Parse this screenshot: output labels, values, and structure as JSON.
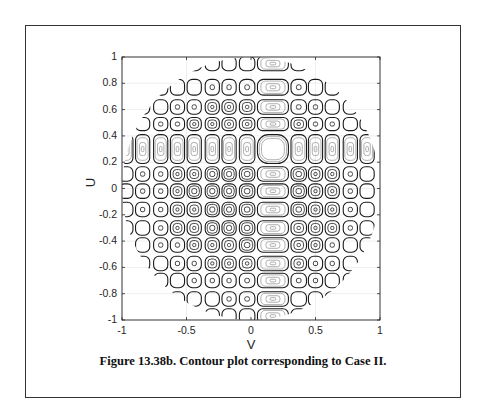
{
  "figure": {
    "caption": "Figure 13.38b. Contour plot corresponding to Case II."
  },
  "chart_data": {
    "type": "contour",
    "title": "",
    "xlabel": "V",
    "ylabel": "U",
    "xlim": [
      -1,
      1
    ],
    "ylim": [
      -1,
      1
    ],
    "x_ticks": [
      -1,
      -0.5,
      0,
      0.5,
      1
    ],
    "x_tick_labels": [
      "-1",
      "-0.5",
      "0",
      "0.5",
      "1"
    ],
    "y_ticks": [
      1,
      0.8,
      0.6,
      0.4,
      0.2,
      0,
      -0.2,
      -0.4,
      -0.6,
      -0.8,
      -1
    ],
    "y_tick_labels": [
      "1",
      "0.8",
      "0.6",
      "0.4",
      "0.2",
      "0",
      "-0.2",
      "-0.4",
      "-0.6",
      "-0.8",
      "-1"
    ],
    "grid": true,
    "domain": "unit circle (V^2 + U^2 <= 1)",
    "main_lobe": {
      "V": 0.17,
      "U": 0.3
    },
    "column_centers_V": [
      -0.97,
      -0.84,
      -0.7,
      -0.57,
      -0.44,
      -0.3,
      -0.17,
      -0.03,
      0.17,
      0.37,
      0.5,
      0.63,
      0.77,
      0.9
    ],
    "column_half_widths": [
      0.055,
      0.055,
      0.055,
      0.055,
      0.055,
      0.055,
      0.055,
      0.06,
      0.12,
      0.06,
      0.055,
      0.055,
      0.055,
      0.055
    ],
    "row_centers_U": [
      0.95,
      0.77,
      0.62,
      0.49,
      0.3,
      0.11,
      -0.02,
      -0.16,
      -0.3,
      -0.43,
      -0.57,
      -0.7,
      -0.84,
      -0.97
    ],
    "row_half_heights": [
      0.055,
      0.06,
      0.055,
      0.05,
      0.11,
      0.055,
      0.055,
      0.055,
      0.055,
      0.055,
      0.055,
      0.055,
      0.055,
      0.055
    ],
    "bright_column_V": 0.17,
    "bright_row_U": 0.3
  },
  "colors": {
    "contour_dark": "#1a1a1a",
    "contour_light": "#9a9a9a",
    "axis": "#262626",
    "grid": "#ebebeb",
    "frame": "#333333"
  }
}
